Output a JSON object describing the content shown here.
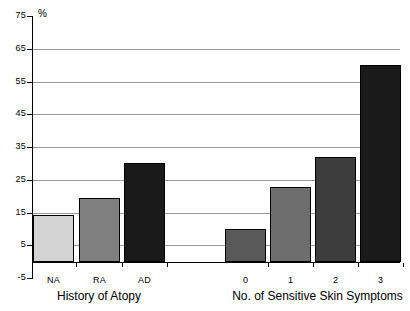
{
  "chart_data": {
    "type": "bar",
    "title": "",
    "subtitle": "",
    "xlabel": "",
    "ylabel": "%",
    "ylim": [
      -5,
      75
    ],
    "ytick_values": [
      75,
      65,
      55,
      45,
      35,
      25,
      15,
      5,
      -5
    ],
    "ytick_labels": [
      "75",
      "65",
      "55",
      "45",
      "35",
      "25",
      "15",
      "5",
      "-5"
    ],
    "grid": true,
    "gridline_values": [
      65,
      55,
      45,
      35,
      25,
      15,
      5
    ],
    "legend": [],
    "legend_position": "none",
    "groups": [
      {
        "name": "History of Atopy",
        "categories": [
          "NA",
          "RA",
          "AD"
        ],
        "values": [
          14.2,
          19.5,
          30.0
        ],
        "colors": [
          "#d4d4d4",
          "#808080",
          "#1a1a1a"
        ]
      },
      {
        "name": "No. of Sensitive Skin Symptoms",
        "categories": [
          "0",
          "1",
          "2",
          "3"
        ],
        "values": [
          10.0,
          22.8,
          32.0,
          60.0
        ],
        "colors": [
          "#595959",
          "#6e6e6e",
          "#3d3d3d",
          "#1a1a1a"
        ]
      }
    ],
    "axis_color": "#000000",
    "gridline_color": "#9a9a9a",
    "background_color": "#ffffff"
  },
  "axis": {
    "percent_symbol": "%"
  }
}
